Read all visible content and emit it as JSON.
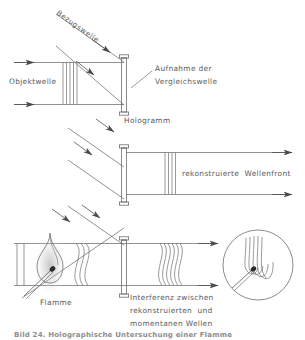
{
  "figure": {
    "language": "de",
    "line_color": "#6e6e6e",
    "text_color": "#5a5a5a",
    "background": "#ffffff"
  },
  "panels": {
    "top": {
      "name": "Aufnahme",
      "labels": {
        "object_wave": "Objektwelle",
        "reference_wave": "Bezugswelle",
        "recording": "Aufnahme der\nVergleichswelle",
        "recording_line1": "Aufnahme der",
        "recording_line2": "Vergleichswelle",
        "hologram": "Hologramm"
      }
    },
    "middle": {
      "name": "Rekonstruktion",
      "labels": {
        "reconstructed_front": "rekonstruierte  Wellenfront"
      }
    },
    "bottom": {
      "name": "Interferenz",
      "labels": {
        "flame": "Flamme",
        "interference_line1": "Interferenz zwischen",
        "interference_line2": "rekonstruierten  und",
        "interference_line3": "momentanen Wellen"
      }
    }
  },
  "caption": {
    "text": "Bild 24. Holographische Untersuchung einer Flamme",
    "visible": "clipped"
  }
}
